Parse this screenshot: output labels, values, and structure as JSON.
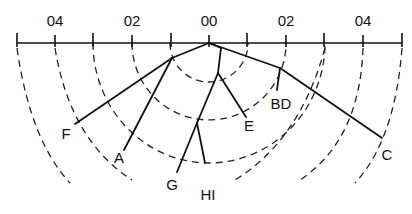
{
  "axis": {
    "tick_labels": [
      {
        "text": "04",
        "x": 55
      },
      {
        "text": "02",
        "x": 132
      },
      {
        "text": "00",
        "x": 209
      },
      {
        "text": "02",
        "x": 286
      },
      {
        "text": "04",
        "x": 363
      }
    ]
  },
  "leaves": {
    "F": "F",
    "A": "A",
    "G": "G",
    "HI": "HI",
    "E": "E",
    "BD": "BD",
    "C": "C"
  }
}
